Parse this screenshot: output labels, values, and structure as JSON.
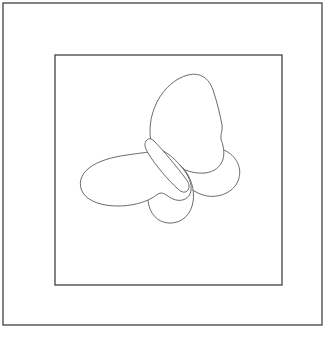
{
  "artwork": {
    "title": "Butterfly line drawing",
    "subject": "butterfly",
    "style": "outline / coloring-page line art",
    "background_color": "#ffffff",
    "stroke_color": "#5a5a5a",
    "frame_stroke_color": "#4f4f4f",
    "canvas": {
      "width": 333,
      "height": 340
    },
    "frames": [
      {
        "name": "outer-frame",
        "x": 3,
        "y": 3,
        "width": 319,
        "height": 322,
        "stroke_width": 1.4
      },
      {
        "name": "inner-frame",
        "x": 55,
        "y": 55,
        "width": 227,
        "height": 230,
        "stroke_width": 1.4
      }
    ],
    "parts": [
      {
        "name": "upper-right-wing",
        "description": "large elongated leaf-shaped forewing angled up-right"
      },
      {
        "name": "left-wing",
        "description": "broad elongated forewing sweeping to the left"
      },
      {
        "name": "right-hindwing",
        "description": "rounded petal lobe at lower right"
      },
      {
        "name": "lower-center-hindwing",
        "description": "rounded hanging lobe below center"
      },
      {
        "name": "body",
        "description": "narrow diagonal capsule from upper-left to lower-right"
      }
    ],
    "stroke_width": 0.9
  }
}
